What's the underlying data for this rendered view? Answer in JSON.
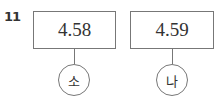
{
  "question": {
    "number": "11"
  },
  "items": [
    {
      "value": "4.58",
      "label": "소"
    },
    {
      "value": "4.59",
      "label": "나"
    }
  ],
  "colors": {
    "border": "#777777",
    "text": "#333333"
  }
}
